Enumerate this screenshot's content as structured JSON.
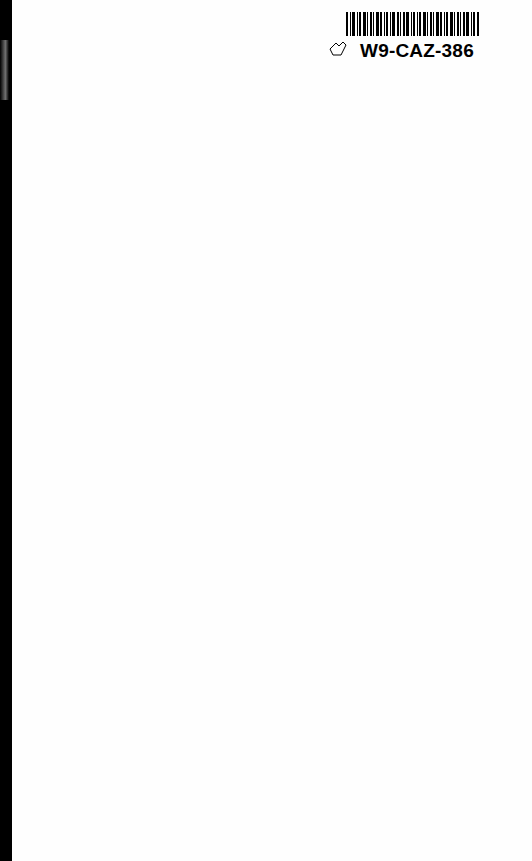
{
  "document": {
    "type": "scanned blank book page",
    "barcode_label": {
      "text": "W9-CAZ-386",
      "icon": "tag-outline-icon"
    }
  }
}
